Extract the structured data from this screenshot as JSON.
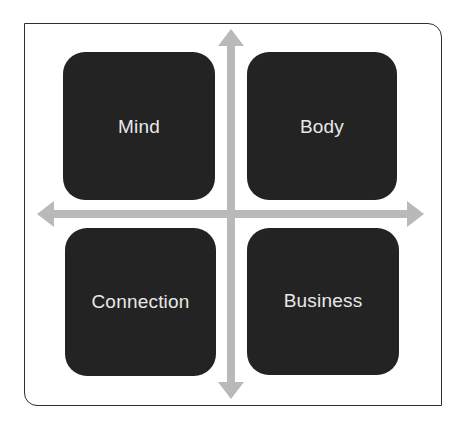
{
  "diagram": {
    "type": "quadrant",
    "colors": {
      "frame_border": "#2e2e2e",
      "quadrant_fill": "#232323",
      "label_text": "#e8e8e8",
      "axis_arrow": "#b9b9b9",
      "background": "#ffffff"
    },
    "quadrants": [
      {
        "position": "top-left",
        "label": "Mind"
      },
      {
        "position": "top-right",
        "label": "Body"
      },
      {
        "position": "bottom-left",
        "label": "Connection"
      },
      {
        "position": "bottom-right",
        "label": "Business"
      }
    ],
    "axes": {
      "vertical": {
        "direction": "bidirectional",
        "icon": "double-headed-arrow-vertical"
      },
      "horizontal": {
        "direction": "bidirectional",
        "icon": "double-headed-arrow-horizontal"
      }
    }
  }
}
